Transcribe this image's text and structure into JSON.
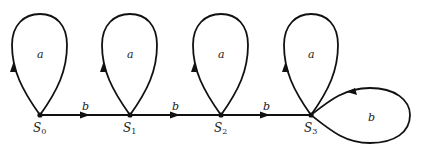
{
  "diagram": {
    "type": "state-transition-graph",
    "nodes": [
      {
        "id": "S0",
        "label": "S",
        "sub": "0"
      },
      {
        "id": "S1",
        "label": "S",
        "sub": "1"
      },
      {
        "id": "S2",
        "label": "S",
        "sub": "2"
      },
      {
        "id": "S3",
        "label": "S",
        "sub": "3"
      }
    ],
    "edges": [
      {
        "from": "S0",
        "to": "S0",
        "label": "a"
      },
      {
        "from": "S0",
        "to": "S1",
        "label": "b"
      },
      {
        "from": "S1",
        "to": "S1",
        "label": "a"
      },
      {
        "from": "S1",
        "to": "S2",
        "label": "b"
      },
      {
        "from": "S2",
        "to": "S2",
        "label": "a"
      },
      {
        "from": "S2",
        "to": "S3",
        "label": "b"
      },
      {
        "from": "S3",
        "to": "S3",
        "label": "a"
      },
      {
        "from": "S3",
        "to": "S3",
        "label": "b"
      }
    ]
  },
  "labels": {
    "loop_a": "a",
    "edge_b": "b",
    "loop_b": "b"
  }
}
